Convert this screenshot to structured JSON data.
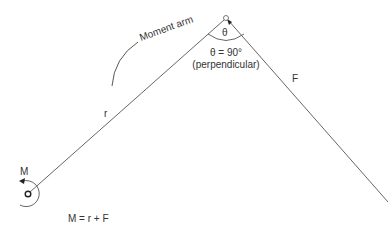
{
  "diagram": {
    "labels": {
      "moment_arm": "Moment arm",
      "theta": "θ",
      "theta_value": "θ = 90°",
      "perpendicular": "(perpendicular)",
      "force": "F",
      "radius": "r",
      "moment": "M",
      "formula": "M = r + F"
    },
    "colors": {
      "line": "#555555",
      "text": "#333333",
      "background": "#ffffff"
    }
  }
}
